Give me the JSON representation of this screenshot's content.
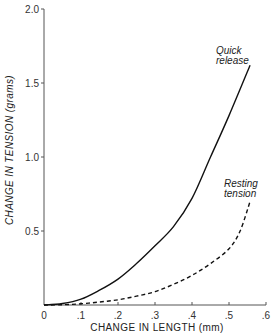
{
  "chart_data": {
    "type": "line",
    "title": "",
    "xlabel": "CHANGE IN LENGTH (mm)",
    "ylabel": "CHANGE IN TENSION (grams)",
    "xlim": [
      0,
      0.6
    ],
    "ylim": [
      0,
      2.0
    ],
    "grid": false,
    "legend": "none (inline annotations)",
    "x_ticks": [
      {
        "value": 0,
        "label": "0"
      },
      {
        "value": 0.1,
        "label": ".1"
      },
      {
        "value": 0.2,
        "label": ".2"
      },
      {
        "value": 0.3,
        "label": ".3"
      },
      {
        "value": 0.4,
        "label": ".4"
      },
      {
        "value": 0.5,
        "label": ".5"
      },
      {
        "value": 0.6,
        "label": ".6"
      }
    ],
    "y_ticks": [
      {
        "value": 0.5,
        "label": "0.5"
      },
      {
        "value": 1.0,
        "label": "1.0"
      },
      {
        "value": 1.5,
        "label": "1.5"
      },
      {
        "value": 2.0,
        "label": "2.0"
      }
    ],
    "series": [
      {
        "name": "Quick release",
        "style": "solid",
        "x": [
          0,
          0.05,
          0.1,
          0.15,
          0.2,
          0.25,
          0.3,
          0.35,
          0.4,
          0.45,
          0.5,
          0.557
        ],
        "y": [
          0,
          0.01,
          0.04,
          0.1,
          0.175,
          0.28,
          0.4,
          0.53,
          0.72,
          1.0,
          1.28,
          1.62
        ]
      },
      {
        "name": "Resting tension",
        "style": "dashed",
        "x": [
          0,
          0.05,
          0.1,
          0.15,
          0.2,
          0.25,
          0.3,
          0.35,
          0.4,
          0.45,
          0.5,
          0.53,
          0.557
        ],
        "y": [
          0,
          0.002,
          0.008,
          0.02,
          0.035,
          0.06,
          0.09,
          0.14,
          0.2,
          0.28,
          0.38,
          0.5,
          0.7
        ]
      }
    ],
    "annotations": [
      {
        "series": "Quick release",
        "lines": [
          "Quick",
          "release"
        ]
      },
      {
        "series": "Resting tension",
        "lines": [
          "Resting",
          "tension"
        ]
      }
    ]
  }
}
